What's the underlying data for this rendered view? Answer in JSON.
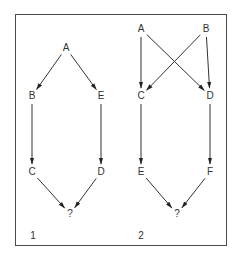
{
  "diagram": {
    "panels": [
      {
        "number": "1",
        "nodes": [
          {
            "id": "A",
            "label": "A",
            "x": 66,
            "y": 48
          },
          {
            "id": "B",
            "label": "B",
            "x": 32,
            "y": 96
          },
          {
            "id": "E",
            "label": "E",
            "x": 101,
            "y": 96
          },
          {
            "id": "C",
            "label": "C",
            "x": 32,
            "y": 172
          },
          {
            "id": "D",
            "label": "D",
            "x": 101,
            "y": 172
          },
          {
            "id": "Q",
            "label": "?",
            "x": 70,
            "y": 214
          }
        ],
        "edges": [
          [
            "A",
            "B"
          ],
          [
            "A",
            "E"
          ],
          [
            "B",
            "C"
          ],
          [
            "E",
            "D"
          ],
          [
            "C",
            "Q"
          ],
          [
            "D",
            "Q"
          ]
        ]
      },
      {
        "number": "2",
        "nodes": [
          {
            "id": "A",
            "label": "A",
            "x": 141,
            "y": 29
          },
          {
            "id": "B",
            "label": "B",
            "x": 206,
            "y": 29
          },
          {
            "id": "C",
            "label": "C",
            "x": 141,
            "y": 96
          },
          {
            "id": "D",
            "label": "D",
            "x": 210,
            "y": 96
          },
          {
            "id": "E",
            "label": "E",
            "x": 141,
            "y": 172
          },
          {
            "id": "F",
            "label": "F",
            "x": 210,
            "y": 172
          },
          {
            "id": "Q",
            "label": "?",
            "x": 177,
            "y": 214
          }
        ],
        "edges": [
          [
            "A",
            "C"
          ],
          [
            "A",
            "D"
          ],
          [
            "B",
            "C"
          ],
          [
            "B",
            "D"
          ],
          [
            "C",
            "E"
          ],
          [
            "D",
            "F"
          ],
          [
            "E",
            "Q"
          ],
          [
            "F",
            "Q"
          ]
        ]
      }
    ],
    "panel_labels": [
      {
        "text": "1",
        "x": 33,
        "y": 236
      },
      {
        "text": "2",
        "x": 141,
        "y": 236
      }
    ]
  }
}
